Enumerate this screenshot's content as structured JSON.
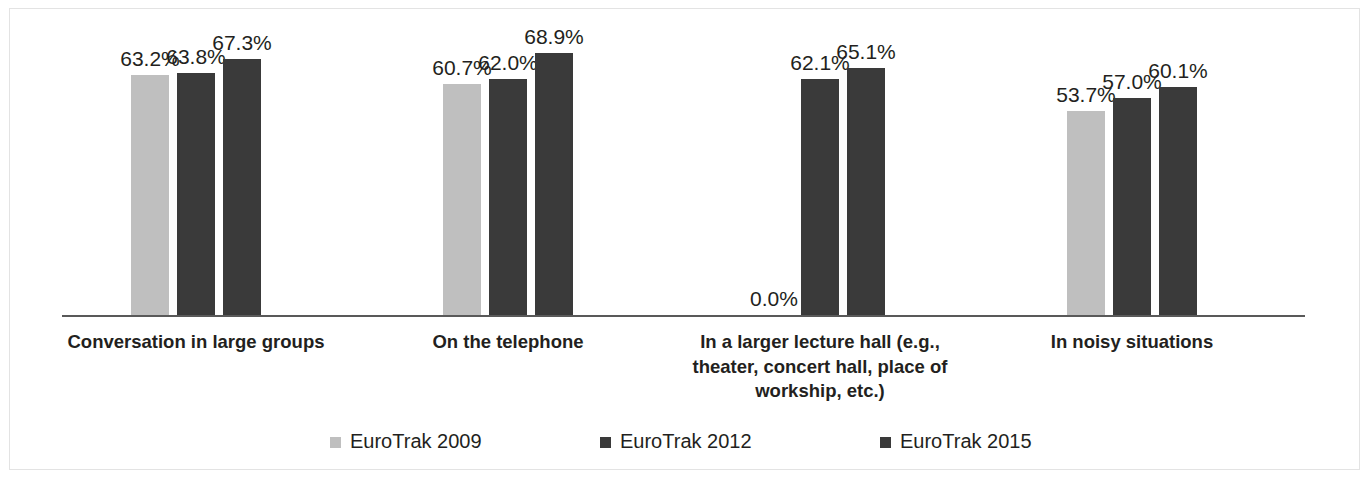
{
  "chart_data": {
    "type": "bar",
    "title": "",
    "subtitle": "",
    "xlabel": "",
    "ylabel": "",
    "grid": false,
    "legend_position": "bottom",
    "ylim": [
      0,
      80
    ],
    "value_suffix": "%",
    "categories": [
      "Conversation in large groups",
      "On the telephone",
      "In a larger lecture hall (e.g.,\ntheater, concert hall, place of\nworkship, etc.)",
      "In noisy situations"
    ],
    "series": [
      {
        "name": "EuroTrak 2009",
        "color": "#bfbfbf",
        "values": [
          63.2,
          60.7,
          0.0,
          53.7
        ],
        "labels": [
          "63.2%",
          "60.7%",
          "0.0%",
          "53.7%"
        ]
      },
      {
        "name": "EuroTrak 2012",
        "color": "#3a3a3a",
        "values": [
          63.8,
          62.0,
          62.1,
          57.0
        ],
        "labels": [
          "63.8%",
          "62.0%",
          "62.1%",
          "57.0%"
        ]
      },
      {
        "name": "EuroTrak 2015",
        "color": "#3a3a3a",
        "values": [
          67.3,
          68.9,
          65.1,
          60.1
        ],
        "labels": [
          "67.3%",
          "68.9%",
          "65.1%",
          "60.1%"
        ]
      }
    ]
  },
  "legend": {
    "items": [
      {
        "label": "EuroTrak 2009",
        "color": "#bfbfbf"
      },
      {
        "label": "EuroTrak 2012",
        "color": "#3a3a3a"
      },
      {
        "label": "EuroTrak 2015",
        "color": "#3a3a3a"
      }
    ]
  },
  "axis": {
    "baseline_color": "#595959"
  }
}
